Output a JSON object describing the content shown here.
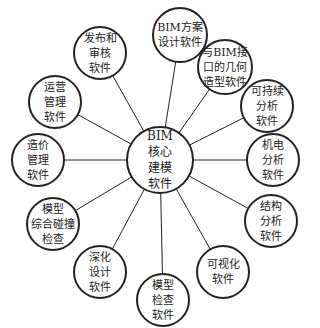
{
  "diagram": {
    "type": "hub-and-spoke",
    "stroke_color": "#222222",
    "background": "#ffffff",
    "center": {
      "id": "core",
      "lines": [
        "BIM",
        "核心",
        "建模",
        "软件"
      ],
      "x": 160,
      "y": 160,
      "r": 33
    },
    "nodes": [
      {
        "id": "scheme-design",
        "lines": [
          "BIM方案",
          "设计软件"
        ],
        "x": 180,
        "y": 35,
        "r": 27
      },
      {
        "id": "geometry-modeling",
        "lines": [
          "与BIM接",
          "口的几何",
          "造型软件"
        ],
        "x": 225,
        "y": 67,
        "r": 27
      },
      {
        "id": "sustainability-analysis",
        "lines": [
          "可持续",
          "分析",
          "软件"
        ],
        "x": 267,
        "y": 106,
        "r": 26
      },
      {
        "id": "mep-analysis",
        "lines": [
          "机电",
          "分析",
          "软件"
        ],
        "x": 273,
        "y": 160,
        "r": 26
      },
      {
        "id": "structural-analysis",
        "lines": [
          "结构",
          "分析",
          "软件"
        ],
        "x": 271,
        "y": 221,
        "r": 26
      },
      {
        "id": "visualization",
        "lines": [
          "可视化",
          "软件"
        ],
        "x": 223,
        "y": 272,
        "r": 26
      },
      {
        "id": "model-checking",
        "lines": [
          "模型",
          "检查",
          "软件"
        ],
        "x": 163,
        "y": 300,
        "r": 26
      },
      {
        "id": "detailed-design",
        "lines": [
          "深化",
          "设计",
          "软件"
        ],
        "x": 100,
        "y": 272,
        "r": 26
      },
      {
        "id": "clash-detection",
        "lines": [
          "模型",
          "综合碰撞",
          "检查"
        ],
        "x": 53,
        "y": 224,
        "r": 26
      },
      {
        "id": "cost-management",
        "lines": [
          "造价",
          "管理",
          "软件"
        ],
        "x": 38,
        "y": 160,
        "r": 26
      },
      {
        "id": "operations-management",
        "lines": [
          "运营",
          "管理",
          "软件"
        ],
        "x": 55,
        "y": 102,
        "r": 26
      },
      {
        "id": "release-review",
        "lines": [
          "发布和",
          "审核",
          "软件"
        ],
        "x": 100,
        "y": 53,
        "r": 26
      }
    ]
  }
}
